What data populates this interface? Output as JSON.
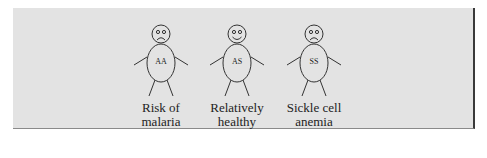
{
  "figures": [
    {
      "genotype": "AA",
      "mood": "sad",
      "label_line1": "Risk of",
      "label_line2": "malaria",
      "cx": 161
    },
    {
      "genotype": "AS",
      "mood": "happy",
      "label_line1": "Relatively",
      "label_line2": "healthy",
      "cx": 237
    },
    {
      "genotype": "SS",
      "mood": "sad",
      "label_line1": "Sickle cell",
      "label_line2": "anemia",
      "cx": 314
    }
  ],
  "colors": {
    "background": "#e3e3e3",
    "stroke": "#333333",
    "border": "#3a3a3a"
  }
}
